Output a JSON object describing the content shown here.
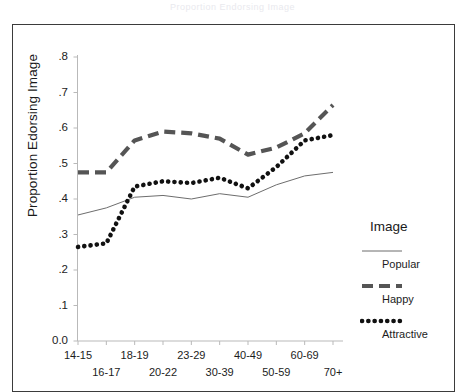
{
  "figure": {
    "top_caption": "Proportion Endorsing Image"
  },
  "axes": {
    "ylabel": "Proportion Edorsing Image",
    "yticks": [
      "0.0",
      ".1",
      ".2",
      ".3",
      ".4",
      ".5",
      ".6",
      ".7",
      ".8"
    ],
    "xticks": [
      "14-15",
      "16-17",
      "18-19",
      "20-22",
      "23-29",
      "30-39",
      "40-49",
      "50-59",
      "60-69",
      "70+"
    ]
  },
  "legend": {
    "title": "Image",
    "entries": [
      {
        "label": "Popular",
        "style": "thin-solid",
        "color": "#6d6d6d"
      },
      {
        "label": "Happy",
        "style": "thick-dashed",
        "color": "#555555"
      },
      {
        "label": "Attractive",
        "style": "dotted",
        "color": "#111111"
      }
    ]
  },
  "chart_data": {
    "type": "line",
    "title": "Proportion Endorsing Image",
    "xlabel": "",
    "ylabel": "Proportion Edorsing Image",
    "categories": [
      "14-15",
      "16-17",
      "18-19",
      "20-22",
      "23-29",
      "30-39",
      "40-49",
      "50-59",
      "60-69",
      "70+"
    ],
    "ylim": [
      0.0,
      0.8
    ],
    "xlim": [
      0,
      9
    ],
    "grid": false,
    "legend_position": "right",
    "series": [
      {
        "name": "Popular",
        "style": "thin-solid",
        "color": "#6d6d6d",
        "values": [
          0.355,
          0.375,
          0.405,
          0.41,
          0.4,
          0.415,
          0.405,
          0.44,
          0.465,
          0.475
        ]
      },
      {
        "name": "Happy",
        "style": "thick-dashed",
        "color": "#555555",
        "values": [
          0.475,
          0.475,
          0.565,
          0.59,
          0.585,
          0.57,
          0.525,
          0.545,
          0.585,
          0.665
        ]
      },
      {
        "name": "Attractive",
        "style": "dotted",
        "color": "#111111",
        "values": [
          0.265,
          0.275,
          0.435,
          0.45,
          0.445,
          0.46,
          0.43,
          0.49,
          0.565,
          0.58
        ]
      }
    ]
  }
}
